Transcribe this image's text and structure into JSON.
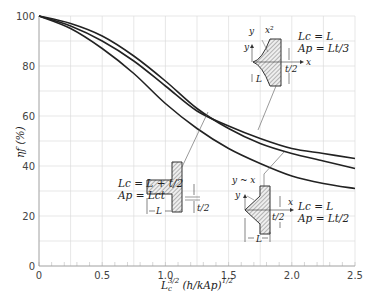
{
  "chart_data": {
    "type": "line",
    "title": "",
    "xlabel": "L_c^{3/2} (h/kA_p)^{1/2}",
    "ylabel": "η_f (%)",
    "xlim": [
      0,
      2.5
    ],
    "ylim": [
      0,
      100
    ],
    "xticks": [
      "0",
      "0.5",
      "1.0",
      "1.5",
      "2.0",
      "2.5"
    ],
    "yticks": [
      "0",
      "20",
      "40",
      "60",
      "80",
      "100"
    ],
    "grid": true,
    "x": [
      0,
      0.25,
      0.5,
      0.75,
      1.0,
      1.25,
      1.5,
      1.75,
      2.0,
      2.25,
      2.5
    ],
    "series": [
      {
        "name": "Rectangular fin (Lc = L + t/2, Ap = Lc t)",
        "values": [
          100,
          97,
          92,
          84,
          74,
          63,
          55,
          49,
          45,
          42,
          39
        ]
      },
      {
        "name": "Triangular fin (Lc = L, Ap = Lt/2)",
        "values": [
          100,
          96,
          90,
          82,
          72,
          62,
          56,
          51,
          47,
          45,
          43
        ]
      },
      {
        "name": "Parabolic fin y ~ x^2 (Lc = L, Ap = Lt/3)",
        "values": [
          100,
          95,
          87,
          77,
          65,
          55,
          47,
          41,
          36,
          33,
          31
        ]
      }
    ],
    "annotations": [
      {
        "fin": "rectangular",
        "lines": [
          "L_c = L + t/2",
          "A_p = L_c t"
        ],
        "dims": [
          "L",
          "t/2"
        ]
      },
      {
        "fin": "parabolic",
        "lines": [
          "L_c = L",
          "A_p = Lt/3"
        ],
        "dims": [
          "L",
          "t/2",
          "x",
          "y",
          "y ~ x^2"
        ]
      },
      {
        "fin": "triangular",
        "lines": [
          "L_c = L",
          "A_p = Lt/2"
        ],
        "dims": [
          "L",
          "t/2",
          "x",
          "y",
          "y ~ x"
        ]
      }
    ]
  },
  "labels": {
    "ylabel": "ηf (%)",
    "xlabel_main": "L",
    "xlabel_sub": "c",
    "xlabel_sup": "3/2",
    "xlabel_rest": " (h/kAp)",
    "xlabel_sup2": "1/2",
    "rect_lc": "Lc = L + t/2",
    "rect_ap": "Ap = Lct",
    "para_lc": "Lc = L",
    "para_ap": "Ap = Lt/3",
    "tri_lc": "Lc = L",
    "tri_ap": "Ap = Lt/2",
    "dim_L": "L",
    "dim_t2": "t/2",
    "axis_x": "x",
    "axis_y": "y",
    "para_curve": "x²",
    "tri_curve": "y ~ x"
  }
}
